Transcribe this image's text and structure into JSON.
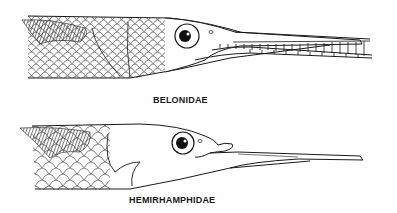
{
  "figure": {
    "panels": [
      {
        "id": "top",
        "label": "BELONIDAE",
        "description": "needlefish head: both jaws elongated with teeth"
      },
      {
        "id": "bottom",
        "label": "HEMIRHAMPHIDAE",
        "description": "halfbeak head: elongated lower jaw, short upper jaw"
      }
    ]
  },
  "colors": {
    "ink": "#1a1a1a",
    "background": "#ffffff"
  }
}
